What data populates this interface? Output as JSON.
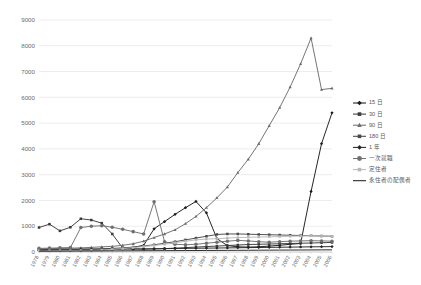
{
  "chart_data": {
    "type": "line",
    "title": "",
    "subtitle": "",
    "xlabel": "",
    "ylabel": "",
    "ylim": [
      0,
      9000
    ],
    "ytick_step": 1000,
    "yticks": [
      0,
      1000,
      2000,
      3000,
      4000,
      5000,
      6000,
      7000,
      8000,
      9000
    ],
    "grid": true,
    "legend_position": "right",
    "categories": [
      "1978",
      "1979",
      "1980",
      "1981",
      "1982",
      "1983",
      "1984",
      "1985",
      "1986",
      "1987",
      "1988",
      "1989",
      "1990",
      "1991",
      "1992",
      "1993",
      "1994",
      "1995",
      "1996",
      "1997",
      "1998",
      "1999",
      "2000",
      "2001",
      "2002",
      "2003",
      "2004",
      "2005",
      "2006"
    ],
    "series": [
      {
        "name": "15 日",
        "color": "#1a1a1a",
        "marker": "diamond",
        "values": [
          60,
          70,
          80,
          70,
          60,
          70,
          80,
          90,
          120,
          180,
          260,
          900,
          1180,
          1460,
          1720,
          1960,
          1520,
          520,
          250,
          200,
          190,
          200,
          230,
          260,
          300,
          330,
          2350,
          4200,
          5400
        ]
      },
      {
        "name": "30 日",
        "color": "#3a3a3a",
        "marker": "square",
        "values": [
          950,
          1080,
          820,
          960,
          1290,
          1240,
          1120,
          700,
          150,
          120,
          110,
          120,
          130,
          150,
          170,
          190,
          210,
          230,
          250,
          270,
          290,
          300,
          310,
          320,
          330,
          340,
          350,
          360,
          370
        ]
      },
      {
        "name": "90 日",
        "color": "#6e6e6e",
        "marker": "triangle",
        "values": [
          120,
          130,
          140,
          150,
          160,
          180,
          200,
          220,
          260,
          320,
          420,
          560,
          700,
          860,
          1100,
          1380,
          1720,
          2100,
          2520,
          3080,
          3600,
          4200,
          4900,
          5600,
          6400,
          7300,
          8300,
          6300,
          6350
        ]
      },
      {
        "name": "180 日",
        "color": "#4a4a4a",
        "marker": "square",
        "values": [
          90,
          100,
          110,
          115,
          120,
          125,
          130,
          140,
          160,
          190,
          230,
          280,
          340,
          400,
          470,
          540,
          610,
          680,
          700,
          700,
          690,
          680,
          670,
          660,
          650,
          640,
          630,
          620,
          610
        ]
      },
      {
        "name": "1 年",
        "color": "#262626",
        "marker": "diamond",
        "values": [
          70,
          75,
          80,
          85,
          90,
          95,
          100,
          105,
          110,
          115,
          120,
          125,
          130,
          135,
          140,
          145,
          150,
          155,
          160,
          165,
          170,
          175,
          180,
          185,
          190,
          195,
          200,
          205,
          210
        ]
      },
      {
        "name": "一次就職",
        "color": "#707070",
        "marker": "circle",
        "values": [
          140,
          150,
          160,
          170,
          950,
          1000,
          1020,
          960,
          880,
          790,
          700,
          1950,
          400,
          300,
          280,
          300,
          340,
          380,
          420,
          450,
          430,
          400,
          380,
          400,
          420,
          430,
          440,
          430,
          420
        ]
      },
      {
        "name": "定住者",
        "color": "#b8b8b8",
        "marker": "square",
        "values": [
          40,
          45,
          50,
          55,
          60,
          70,
          80,
          100,
          130,
          170,
          210,
          250,
          300,
          360,
          420,
          470,
          500,
          520,
          540,
          560,
          570,
          580,
          590,
          600,
          610,
          620,
          630,
          620,
          610
        ]
      },
      {
        "name": "永住者の配偶者",
        "color": "#1f1f1f",
        "marker": "none",
        "values": [
          30,
          30,
          32,
          34,
          36,
          38,
          40,
          42,
          44,
          46,
          48,
          50,
          52,
          54,
          56,
          58,
          60,
          62,
          64,
          66,
          68,
          70,
          72,
          74,
          76,
          78,
          80,
          82,
          84
        ]
      }
    ]
  },
  "footer": {
    "caption": ""
  }
}
